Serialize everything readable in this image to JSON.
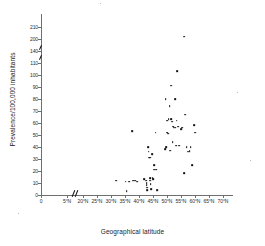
{
  "chart_data": {
    "type": "scatter",
    "title": "",
    "xlabel": "Geographical latitude",
    "ylabel": "Prevalence/100,000 inhabitants",
    "grid": false,
    "legend": null,
    "x_tick_labels": [
      "0",
      "5°N",
      "20°N",
      "25°N",
      "30°N",
      "35°N",
      "40°N",
      "45°N",
      "50°N",
      "55°N",
      "60°N",
      "65°N",
      "70°N"
    ],
    "x_tick_values": [
      0,
      5,
      20,
      25,
      30,
      35,
      40,
      45,
      50,
      55,
      60,
      65,
      70
    ],
    "x_axis_break_between": [
      5,
      20
    ],
    "y_tick_labels": [
      "0",
      "10",
      "20",
      "30",
      "40",
      "50",
      "60",
      "70",
      "80",
      "90",
      "100",
      "110",
      "140",
      "200",
      "210"
    ],
    "y_tick_values": [
      0,
      10,
      20,
      30,
      40,
      50,
      60,
      70,
      80,
      90,
      100,
      110,
      140,
      200,
      210
    ],
    "y_axis_compressed_above": 110,
    "ylim": [
      0,
      210
    ],
    "xlim": [
      0,
      70
    ],
    "marker": "square-dot",
    "marker_color": "#111111",
    "points": [
      {
        "x": 31.8,
        "y": 12
      },
      {
        "x": 35.2,
        "y": 11
      },
      {
        "x": 35.6,
        "y": 3
      },
      {
        "x": 36.4,
        "y": 11
      },
      {
        "x": 37.6,
        "y": 53
      },
      {
        "x": 37.9,
        "y": 12
      },
      {
        "x": 38.7,
        "y": 12
      },
      {
        "x": 39.4,
        "y": 11
      },
      {
        "x": 41.9,
        "y": 13
      },
      {
        "x": 42.6,
        "y": 12
      },
      {
        "x": 42.7,
        "y": 10
      },
      {
        "x": 42.7,
        "y": 8
      },
      {
        "x": 42.8,
        "y": 6
      },
      {
        "x": 43.0,
        "y": 4
      },
      {
        "x": 43.3,
        "y": 40
      },
      {
        "x": 43.4,
        "y": 36
      },
      {
        "x": 43.5,
        "y": 31
      },
      {
        "x": 43.8,
        "y": 31
      },
      {
        "x": 43.9,
        "y": 31
      },
      {
        "x": 44.0,
        "y": 14
      },
      {
        "x": 44.1,
        "y": 12
      },
      {
        "x": 44.2,
        "y": 9
      },
      {
        "x": 44.3,
        "y": 5
      },
      {
        "x": 44.6,
        "y": 34
      },
      {
        "x": 44.9,
        "y": 14
      },
      {
        "x": 45.1,
        "y": 13
      },
      {
        "x": 45.3,
        "y": 25
      },
      {
        "x": 45.5,
        "y": 21
      },
      {
        "x": 45.9,
        "y": 52
      },
      {
        "x": 46.2,
        "y": 21
      },
      {
        "x": 46.6,
        "y": 4
      },
      {
        "x": 49.4,
        "y": 38
      },
      {
        "x": 49.5,
        "y": 80
      },
      {
        "x": 49.8,
        "y": 40
      },
      {
        "x": 50.0,
        "y": 62
      },
      {
        "x": 50.1,
        "y": 52
      },
      {
        "x": 50.3,
        "y": 51
      },
      {
        "x": 50.6,
        "y": 63
      },
      {
        "x": 50.9,
        "y": 74
      },
      {
        "x": 51.1,
        "y": 37
      },
      {
        "x": 51.4,
        "y": 63
      },
      {
        "x": 51.6,
        "y": 91
      },
      {
        "x": 51.9,
        "y": 61
      },
      {
        "x": 52.0,
        "y": 44
      },
      {
        "x": 52.2,
        "y": 57
      },
      {
        "x": 52.4,
        "y": 56
      },
      {
        "x": 52.8,
        "y": 80
      },
      {
        "x": 53.0,
        "y": 56
      },
      {
        "x": 53.2,
        "y": 41
      },
      {
        "x": 53.5,
        "y": 62
      },
      {
        "x": 53.7,
        "y": 103
      },
      {
        "x": 53.9,
        "y": 57
      },
      {
        "x": 54.4,
        "y": 41
      },
      {
        "x": 55.0,
        "y": 55
      },
      {
        "x": 55.4,
        "y": 56
      },
      {
        "x": 56.1,
        "y": 202
      },
      {
        "x": 56.2,
        "y": 18
      },
      {
        "x": 56.6,
        "y": 67
      },
      {
        "x": 57.0,
        "y": 40
      },
      {
        "x": 57.4,
        "y": 36
      },
      {
        "x": 57.8,
        "y": 36
      },
      {
        "x": 58.1,
        "y": 37
      },
      {
        "x": 58.4,
        "y": 40
      },
      {
        "x": 58.9,
        "y": 25
      },
      {
        "x": 59.6,
        "y": 58
      },
      {
        "x": 60.0,
        "y": 52
      }
    ]
  },
  "figure": {
    "x_axis_title": "Geographical latitude",
    "y_axis_title": "Prevalence/100,000 inhabitants"
  }
}
